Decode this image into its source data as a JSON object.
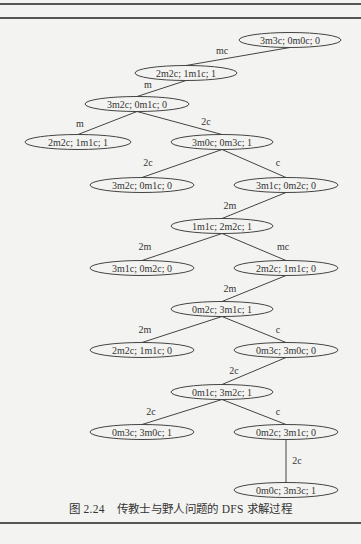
{
  "figure": {
    "number": "图 2.24",
    "caption": "传教士与野人问题的 DFS 求解过程"
  },
  "nodes": [
    {
      "id": "n0",
      "label": "3m3c; 0m0c; 0",
      "cx": 290,
      "cy": 40,
      "rx": 51
    },
    {
      "id": "n1",
      "label": "2m2c; 1m1c; 1",
      "cx": 186,
      "cy": 73,
      "rx": 51
    },
    {
      "id": "n2",
      "label": "3m2c; 0m1c; 0",
      "cx": 137,
      "cy": 104,
      "rx": 52
    },
    {
      "id": "n3",
      "label": "2m2c; 1m1c; 1",
      "cx": 78,
      "cy": 142,
      "rx": 53
    },
    {
      "id": "n4",
      "label": "3m0c; 0m3c; 1",
      "cx": 222,
      "cy": 142,
      "rx": 51
    },
    {
      "id": "n5",
      "label": "3m2c; 0m1c; 0",
      "cx": 142,
      "cy": 185,
      "rx": 52
    },
    {
      "id": "n6",
      "label": "3m1c; 0m2c; 0",
      "cx": 286,
      "cy": 185,
      "rx": 52
    },
    {
      "id": "n7",
      "label": "1m1c; 2m2c; 1",
      "cx": 222,
      "cy": 226,
      "rx": 51
    },
    {
      "id": "n8",
      "label": "3m1c; 0m2c; 0",
      "cx": 142,
      "cy": 268,
      "rx": 52
    },
    {
      "id": "n9",
      "label": "2m2c; 1m1c; 0",
      "cx": 286,
      "cy": 268,
      "rx": 52
    },
    {
      "id": "n10",
      "label": "0m2c; 3m1c; 1",
      "cx": 222,
      "cy": 309,
      "rx": 51
    },
    {
      "id": "n11",
      "label": "2m2c; 1m1c; 0",
      "cx": 142,
      "cy": 350,
      "rx": 52
    },
    {
      "id": "n12",
      "label": "0m3c; 3m0c; 0",
      "cx": 286,
      "cy": 350,
      "rx": 52
    },
    {
      "id": "n13",
      "label": "0m1c; 3m2c; 1",
      "cx": 222,
      "cy": 392,
      "rx": 51
    },
    {
      "id": "n14",
      "label": "0m3c; 3m0c; 1",
      "cx": 142,
      "cy": 432,
      "rx": 52
    },
    {
      "id": "n15",
      "label": "0m2c; 3m1c; 0",
      "cx": 286,
      "cy": 432,
      "rx": 52
    },
    {
      "id": "n16",
      "label": "0m0c; 3m3c; 1",
      "cx": 286,
      "cy": 490,
      "rx": 52
    }
  ],
  "edges": [
    {
      "from": "n0",
      "to": "n1",
      "label": "mc",
      "lx": 222,
      "ly": 54
    },
    {
      "from": "n1",
      "to": "n2",
      "label": "m",
      "lx": 148,
      "ly": 88
    },
    {
      "from": "n2",
      "to": "n3",
      "label": "m",
      "lx": 80,
      "ly": 127
    },
    {
      "from": "n2",
      "to": "n4",
      "label": "2c",
      "lx": 206,
      "ly": 125
    },
    {
      "from": "n4",
      "to": "n5",
      "label": "2c",
      "lx": 148,
      "ly": 166
    },
    {
      "from": "n4",
      "to": "n6",
      "label": "c",
      "lx": 278,
      "ly": 166
    },
    {
      "from": "n6",
      "to": "n7",
      "label": "2m",
      "lx": 230,
      "ly": 209
    },
    {
      "from": "n7",
      "to": "n8",
      "label": "2m",
      "lx": 145,
      "ly": 250
    },
    {
      "from": "n7",
      "to": "n9",
      "label": "mc",
      "lx": 283,
      "ly": 250
    },
    {
      "from": "n9",
      "to": "n10",
      "label": "2m",
      "lx": 230,
      "ly": 292
    },
    {
      "from": "n10",
      "to": "n11",
      "label": "2m",
      "lx": 145,
      "ly": 333
    },
    {
      "from": "n10",
      "to": "n12",
      "label": "c",
      "lx": 278,
      "ly": 333
    },
    {
      "from": "n12",
      "to": "n13",
      "label": "2c",
      "lx": 234,
      "ly": 374
    },
    {
      "from": "n13",
      "to": "n14",
      "label": "2c",
      "lx": 151,
      "ly": 415
    },
    {
      "from": "n13",
      "to": "n15",
      "label": "c",
      "lx": 278,
      "ly": 415
    },
    {
      "from": "n15",
      "to": "n16",
      "label": "2c",
      "lx": 297,
      "ly": 464
    }
  ],
  "colors": {
    "background": "#f3f3f1",
    "stroke": "#444444",
    "text": "#333333"
  }
}
